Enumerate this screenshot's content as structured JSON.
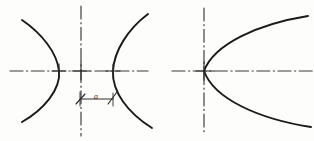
{
  "figure": {
    "background_color": "#fdfdfc",
    "stroke_color": "#1a1a1a",
    "centerline_color": "#3a3a3a",
    "annotations": {
      "dimension_label": "a"
    },
    "left_figure": {
      "name": "concave-convex-pair",
      "curves": [
        {
          "name": "left-arc",
          "type": "arc-open-left",
          "vertex": {
            "x": 59,
            "y": 71
          },
          "top_end": {
            "x": 22,
            "y": 20
          },
          "bottom_end": {
            "x": 22,
            "y": 122
          }
        },
        {
          "name": "right-arc",
          "type": "arc-open-right",
          "vertex": {
            "x": 113,
            "y": 71
          },
          "top_end": {
            "x": 148,
            "y": 14
          },
          "bottom_end": {
            "x": 152,
            "y": 128
          }
        }
      ],
      "horizontal_centerline": {
        "x1": 10,
        "x2": 148,
        "y": 71
      },
      "vertical_centerline": {
        "x": 81,
        "y1": 6,
        "y2": 136
      },
      "center_crosses": [
        {
          "x": 59,
          "y": 71
        },
        {
          "x": 81,
          "y": 71
        },
        {
          "x": 113,
          "y": 71
        }
      ],
      "dimension": {
        "label": "a",
        "from_x": 80,
        "to_x": 113,
        "y": 99,
        "label_x": 94,
        "label_y": 95
      }
    },
    "right_figure": {
      "name": "parabola",
      "curves": [
        {
          "name": "parabola-open-right",
          "type": "parabola-open-right",
          "vertex": {
            "x": 204,
            "y": 71
          },
          "top_end": {
            "x": 308,
            "y": 16
          },
          "bottom_end": {
            "x": 311,
            "y": 127
          }
        }
      ],
      "horizontal_centerline": {
        "x1": 172,
        "x2": 314,
        "y": 71
      },
      "vertical_centerline": {
        "x": 204,
        "y1": 8,
        "y2": 133
      },
      "center_crosses": [
        {
          "x": 204,
          "y": 71
        }
      ]
    }
  }
}
